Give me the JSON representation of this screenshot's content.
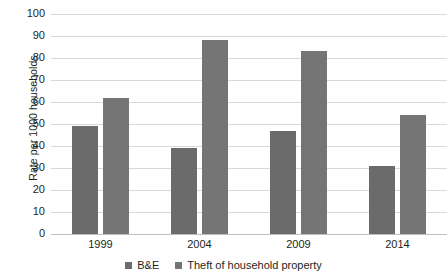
{
  "chart_data": {
    "type": "bar",
    "title": "",
    "subtitle": "",
    "xlabel": "",
    "ylabel": "Rate per 1000 households",
    "categories": [
      "1999",
      "2004",
      "2009",
      "2014"
    ],
    "series": [
      {
        "name": "B&E",
        "values": [
          49,
          39,
          47,
          31
        ],
        "color": "#6b6b6b"
      },
      {
        "name": "Theft of household property",
        "values": [
          62,
          88,
          83,
          54
        ],
        "color": "#757575"
      }
    ],
    "ylim": [
      0,
      100
    ],
    "ytick_step": 10,
    "yticks": [
      "0",
      "10",
      "20",
      "30",
      "40",
      "50",
      "60",
      "70",
      "80",
      "90",
      "100"
    ],
    "grid": "horizontal",
    "legend_position": "bottom",
    "background": "#ffffff",
    "gridline_color": "#d9d9d9",
    "axis_color": "#bfbfbf",
    "text_color": "#231f20"
  }
}
